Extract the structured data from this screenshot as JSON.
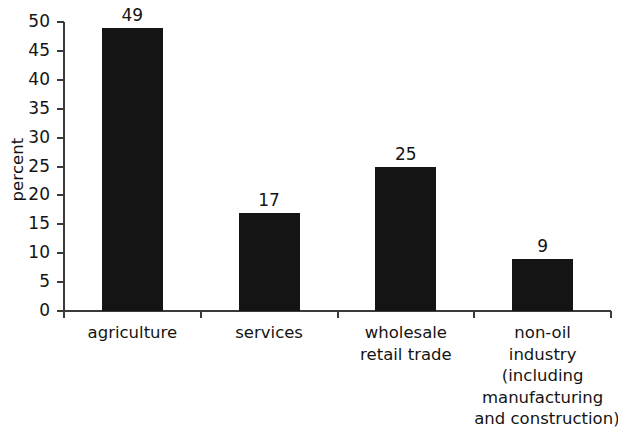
{
  "chart_data": {
    "type": "bar",
    "title": "",
    "subtitle": "",
    "xlabel": "",
    "ylabel": "percent",
    "categories": [
      "agriculture",
      "services",
      "wholesale retail trade",
      "non-oil industry (including manufacturing and construction)"
    ],
    "category_lines": [
      [
        "agriculture"
      ],
      [
        "services"
      ],
      [
        "wholesale",
        "retail trade"
      ],
      [
        "non-oil",
        "industry",
        "(including",
        "manufacturing",
        "and construction)"
      ]
    ],
    "values": [
      49,
      17,
      25,
      9
    ],
    "value_labels": [
      "49",
      "17",
      "25",
      "9"
    ],
    "ylim": [
      0,
      50
    ],
    "yticks": [
      0,
      5,
      10,
      15,
      20,
      25,
      30,
      35,
      40,
      45,
      50
    ],
    "ytick_labels": [
      "0",
      "5",
      "10",
      "15",
      "20",
      "25",
      "30",
      "35",
      "40",
      "45",
      "50"
    ],
    "grid": false,
    "legend": false,
    "bar_color": "#141414",
    "axis_color": "#3a3a3a",
    "background": "#ffffff"
  }
}
